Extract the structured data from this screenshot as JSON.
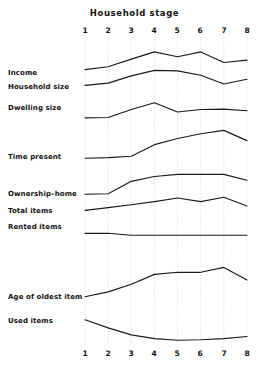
{
  "chart_data": {
    "type": "line",
    "title": "Household stage",
    "xlabel": "",
    "ylabel": "",
    "grid": true,
    "grid_orientation": "vertical",
    "legend": "left-row-labels",
    "x": [
      1,
      2,
      3,
      4,
      5,
      6,
      7,
      8
    ],
    "xtick_labels": [
      "1",
      "2",
      "3",
      "4",
      "5",
      "6",
      "7",
      "8"
    ],
    "xtick_labels_bottom": [
      "1",
      "2",
      "3",
      "4",
      "5",
      "6",
      "7",
      "8"
    ],
    "xlim": [
      1,
      8
    ],
    "note": "Nine small-multiple trend lines sharing one x-axis (household stage 1-8). Each series is drawn on its own vertical band; y-values below are relative band units (0 = band baseline, 1 = band top).",
    "series": [
      {
        "name": "Income",
        "label": "Income",
        "values": [
          0.18,
          0.3,
          0.62,
          0.92,
          0.72,
          0.92,
          0.48,
          0.58
        ]
      },
      {
        "name": "Household size",
        "label": "Household size",
        "values": [
          0.12,
          0.22,
          0.55,
          0.8,
          0.78,
          0.58,
          0.18,
          0.4
        ]
      },
      {
        "name": "Dwelling size",
        "label": "Dwelling size",
        "values": [
          0.1,
          0.12,
          0.5,
          0.82,
          0.38,
          0.5,
          0.52,
          0.44
        ]
      },
      {
        "name": "Time present",
        "label": "Time present",
        "values": [
          0.08,
          0.1,
          0.14,
          0.48,
          0.66,
          0.8,
          0.9,
          0.6
        ]
      },
      {
        "name": "Ownership-home",
        "label": "Ownership–home",
        "values": [
          0.1,
          0.12,
          0.58,
          0.76,
          0.84,
          0.84,
          0.84,
          0.62
        ]
      },
      {
        "name": "Total items",
        "label": "Total items",
        "values": [
          0.18,
          0.32,
          0.46,
          0.62,
          0.8,
          0.62,
          0.84,
          0.4
        ]
      },
      {
        "name": "Rented items",
        "label": "Rented items",
        "values": [
          0.3,
          0.3,
          0.08,
          0.08,
          0.08,
          0.08,
          0.08,
          0.08
        ]
      },
      {
        "name": "Age of oldest item",
        "label": "Age of oldest item",
        "values": [
          0.12,
          0.26,
          0.48,
          0.76,
          0.82,
          0.82,
          0.96,
          0.6
        ]
      },
      {
        "name": "Used items",
        "label": "Used items",
        "values": [
          0.86,
          0.56,
          0.3,
          0.16,
          0.1,
          0.12,
          0.16,
          0.24
        ]
      }
    ]
  },
  "chart": {
    "title": "Household stage",
    "top_ticks": [
      "1",
      "2",
      "3",
      "4",
      "5",
      "6",
      "7",
      "8"
    ],
    "bottom_ticks": [
      "1",
      "2",
      "3",
      "4",
      "5",
      "6",
      "7",
      "8"
    ],
    "labels": {
      "income": "Income",
      "household_size": "Household size",
      "dwelling_size": "Dwelling size",
      "time_present": "Time present",
      "ownership_home": "Ownership–home",
      "total_items": "Total items",
      "rented_items": "Rented items",
      "age_of_oldest_item": "Age of oldest item",
      "used_items": "Used items"
    }
  },
  "colors": {
    "line": "#1a1a1a",
    "grid": "#c9c9c9",
    "text": "#111111",
    "background": "#ffffff"
  }
}
